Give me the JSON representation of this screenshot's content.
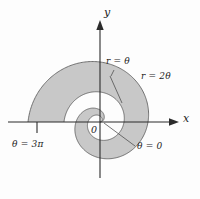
{
  "figure": {
    "background_color": "#fdfdfd",
    "shaded_region_color": "#c8c8c8",
    "outline_color": "#5c5c5c",
    "axis_color": "#2b2b2b"
  },
  "axes": {
    "x_label": "x",
    "y_label": "y",
    "origin_label": "0"
  },
  "annotations": {
    "inner_curve": "r = θ",
    "outer_curve": "r = 2θ",
    "theta_start": "θ = 0",
    "theta_end": "θ = 3π"
  },
  "chart_data": {
    "type": "line",
    "title": "",
    "xlabel": "x",
    "ylabel": "y",
    "coordinate_system": "polar",
    "grid": false,
    "legend": "none",
    "xlim": [
      -3.6,
      3.6
    ],
    "ylim": [
      -3.6,
      3.6
    ],
    "theta_range": [
      0,
      9.42477796
    ],
    "theta_range_label": [
      "θ = 0",
      "θ = 3π"
    ],
    "shaded_between_series": true,
    "series": [
      {
        "name": "r = θ",
        "equation": "r = theta",
        "coefficient": 1,
        "theta_start": 0,
        "theta_end": 9.42477796,
        "r_at_theta_end": 9.42477796,
        "role": "inner boundary"
      },
      {
        "name": "r = 2θ",
        "equation": "r = 2*theta",
        "coefficient": 2,
        "theta_start": 0,
        "theta_end": 9.42477796,
        "r_at_theta_end": 18.84955592,
        "role": "outer boundary"
      }
    ],
    "annotations": [
      {
        "text": "r = θ",
        "target": "inner spiral, upper region"
      },
      {
        "text": "r = 2θ",
        "target": "outer spiral, upper right"
      },
      {
        "text": "θ = 0",
        "target": "origin ray along positive x-axis"
      },
      {
        "text": "θ = 3π",
        "target": "negative x-axis terminal point"
      }
    ]
  }
}
